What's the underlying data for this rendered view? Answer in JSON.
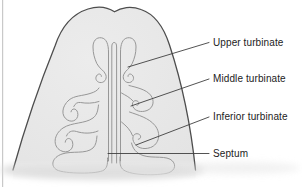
{
  "labels": {
    "upper_turbinate": "Upper turbinate",
    "middle_turbinate": "Middle turbinate",
    "inferior_turbinate": "Inferior turbinate",
    "septum": "Septum"
  },
  "colors": {
    "background": "#ffffff",
    "diagram_fill": "#e6e6e6",
    "diagram_outline": "#4d4d4d",
    "inner_line": "#979797",
    "leader_line": "#3f3f3f",
    "label_text": "#1c1c1c",
    "left_border": "#c9c9c9",
    "bottom_fade": "#dcdcdc"
  }
}
